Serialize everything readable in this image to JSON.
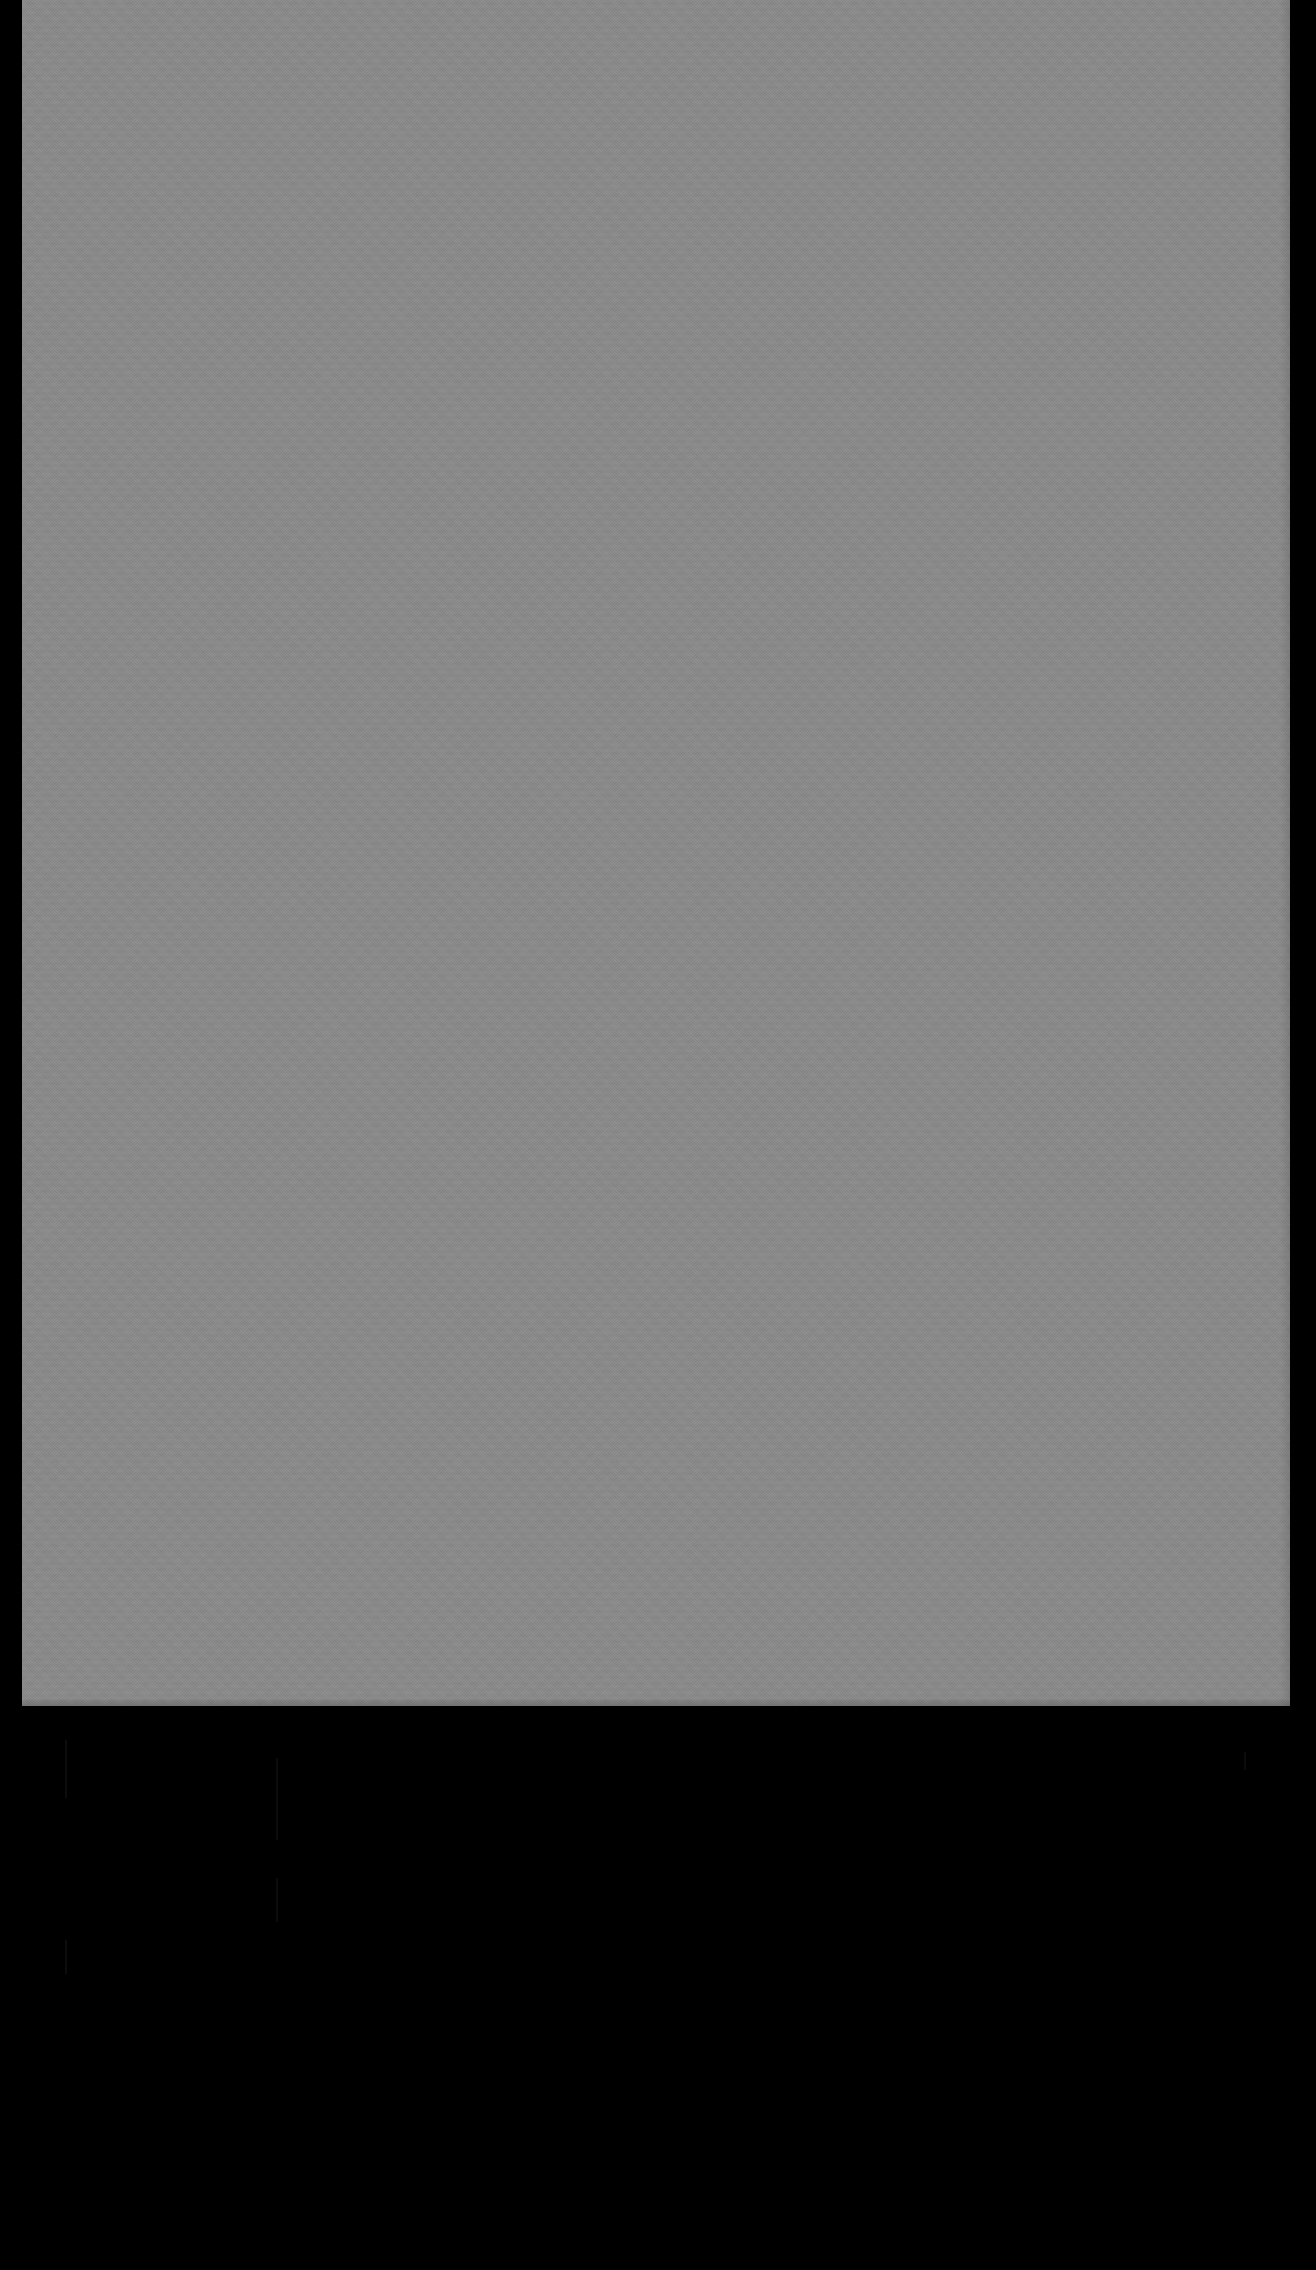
{
  "capture": {
    "width": 1316,
    "height": 2270,
    "background_color": "#000000",
    "description": "Near-featureless capture: a single large flat mid-gray rectangle on a black background. No text, icons, controls, or other UI chrome are legible anywhere in the frame.",
    "visible_text": ""
  },
  "gray_panel": {
    "name": "gray-panel",
    "fill_color": "#8a8a8a",
    "x": 22,
    "y": 0,
    "width": 1268,
    "height": 1706,
    "content": "",
    "notes": "Uniform mid-gray fill with faint blocky compression noise; no rendered content."
  },
  "black_margins": {
    "left": {
      "name": "left-black-margin",
      "color": "#000000",
      "x": 0,
      "width": 22
    },
    "right": {
      "name": "right-black-margin",
      "color": "#000000",
      "x": 1290,
      "width": 26
    },
    "bottom": {
      "name": "lower-black-area",
      "color": "#000000",
      "y": 1706,
      "height": 564
    }
  },
  "artifacts": [
    {
      "name": "faint-artifact-a",
      "color": "#0c0c0c",
      "x": 65,
      "y": 1740,
      "width": 2,
      "height": 58
    },
    {
      "name": "faint-artifact-b",
      "color": "#0c0c0c",
      "x": 65,
      "y": 1940,
      "width": 2,
      "height": 34
    },
    {
      "name": "faint-artifact-c",
      "color": "#0c0c0c",
      "x": 276,
      "y": 1758,
      "width": 2,
      "height": 82
    },
    {
      "name": "faint-artifact-d",
      "color": "#0c0c0c",
      "x": 276,
      "y": 1878,
      "width": 2,
      "height": 44
    },
    {
      "name": "faint-artifact-e",
      "color": "#0c0c0c",
      "x": 1244,
      "y": 1752,
      "width": 2,
      "height": 18
    }
  ]
}
